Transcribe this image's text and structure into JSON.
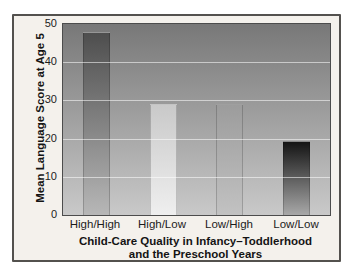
{
  "chart_data": {
    "type": "bar",
    "title": "",
    "categories": [
      "High/High",
      "High/Low",
      "Low/High",
      "Low/Low"
    ],
    "values": [
      48,
      29,
      29,
      19.5
    ],
    "ylabel": "Mean Language Score at Age 5",
    "xlabel_line1": "Child-Care Quality in Infancy–Toddlerhood",
    "xlabel_line2": "and the Preschool Years",
    "ylim": [
      0,
      50
    ],
    "yticks": [
      0,
      10,
      20,
      30,
      40,
      50
    ],
    "grid": "horizontal",
    "legend_position": "none",
    "bar_gradients": [
      {
        "top": "#4e4e4e",
        "bottom": "#b7b7b7"
      },
      {
        "top": "#c9c9c9",
        "bottom": "#efefef"
      },
      {
        "top": "#9c9c9c",
        "bottom": "#c2c2c2"
      },
      {
        "top": "#141414",
        "bottom": "#a8a8a8"
      }
    ]
  },
  "colors": {
    "page_background": "#ffffff",
    "panel_background": "#f4f1ec",
    "panel_border": "#53514e",
    "plot_gradient_top": "#787878",
    "plot_gradient_bottom": "#c9c9c9",
    "plot_border": "#4c4c4c",
    "gridline": "rgba(255,255,255,0.55)",
    "text": "#1c1c1c"
  }
}
